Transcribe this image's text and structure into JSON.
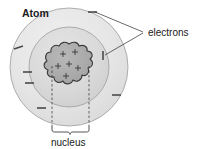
{
  "figure": {
    "title": "Atom",
    "type": "labelled-science-diagram"
  },
  "labels": {
    "electrons": "electrons",
    "nucleus": "nucleus"
  },
  "colors": {
    "outer_shell_fill": "#e3e3e3",
    "inner_shell_fill": "#d6d6d6",
    "nucleus_fill": "#a9a9a9",
    "shell_stroke": "#9a9a9a",
    "nucleus_stroke": "#3a3a3a",
    "line_color": "#2b2b2b",
    "text_color": "#1a1a1a",
    "background": "#ffffff"
  },
  "diagram": {
    "outer_shell": {
      "cx": 69,
      "cy": 67,
      "r": 59
    },
    "inner_shell": {
      "cx": 69,
      "cy": 67,
      "r": 40
    },
    "nucleus": {
      "cx": 69,
      "cy": 64,
      "r": 20,
      "bumps": 13
    },
    "proton_count": 6,
    "protons": [
      {
        "x": 63,
        "y": 54
      },
      {
        "x": 75,
        "y": 52
      },
      {
        "x": 69,
        "y": 64
      },
      {
        "x": 58,
        "y": 66
      },
      {
        "x": 78,
        "y": 68
      },
      {
        "x": 66,
        "y": 76
      }
    ],
    "electron_count": 7,
    "electrons": [
      {
        "x": 19,
        "y": 47,
        "angle": -32,
        "shell": "outer"
      },
      {
        "x": 93,
        "y": 12,
        "angle": 0,
        "shell": "outer"
      },
      {
        "x": 116,
        "y": 95,
        "angle": 0,
        "shell": "outer"
      },
      {
        "x": 41,
        "y": 108,
        "angle": 0,
        "shell": "outer"
      },
      {
        "x": 30,
        "y": 83,
        "angle": 0,
        "shell": "inner"
      },
      {
        "x": 103,
        "y": 55,
        "angle": 90,
        "shell": "inner"
      },
      {
        "x": 27,
        "y": 73,
        "angle": 0,
        "shell": "inner"
      }
    ],
    "nucleus_brace": {
      "left": 52,
      "right": 89,
      "y": 130
    }
  }
}
